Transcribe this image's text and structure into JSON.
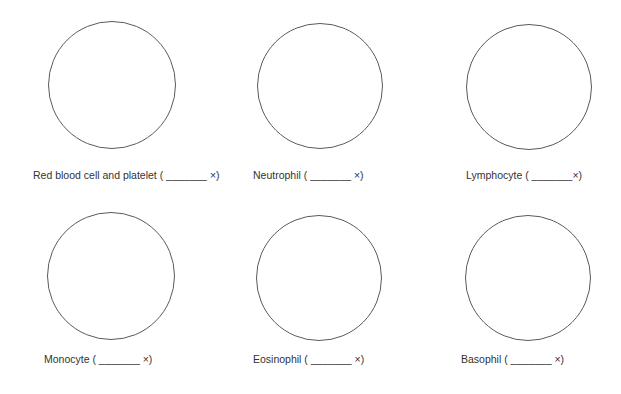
{
  "worksheet": {
    "panels": [
      {
        "id": "rbc-platelet",
        "label": "Red blood cell and platelet ( _______ ×)",
        "circle": {
          "cx": 112,
          "cy": 85,
          "r": 64
        },
        "label_pos": {
          "x": 33,
          "y": 169
        }
      },
      {
        "id": "neutrophil",
        "label": "Neutrophil ( _______ ×)",
        "circle": {
          "cx": 320,
          "cy": 86,
          "r": 63
        },
        "label_pos": {
          "x": 253,
          "y": 169
        }
      },
      {
        "id": "lymphocyte",
        "label": "Lymphocyte ( _______×)",
        "circle": {
          "cx": 529,
          "cy": 87,
          "r": 63
        },
        "label_pos": {
          "x": 466,
          "y": 169
        }
      },
      {
        "id": "monocyte",
        "label": "Monocyte ( _______ ×)",
        "circle": {
          "cx": 111,
          "cy": 276,
          "r": 64
        },
        "label_pos": {
          "x": 44,
          "y": 353
        }
      },
      {
        "id": "eosinophil",
        "label": "Eosinophil ( _______ ×)",
        "circle": {
          "cx": 319,
          "cy": 278,
          "r": 63
        },
        "label_pos": {
          "x": 253,
          "y": 353
        }
      },
      {
        "id": "basophil",
        "label": "Basophil ( _______ ×)",
        "circle": {
          "cx": 528,
          "cy": 278,
          "r": 63
        },
        "label_pos": {
          "x": 461,
          "y": 353
        }
      }
    ],
    "colors": {
      "circle_stroke": "#5a5a5a",
      "text": "#333333",
      "background": "#ffffff"
    }
  }
}
